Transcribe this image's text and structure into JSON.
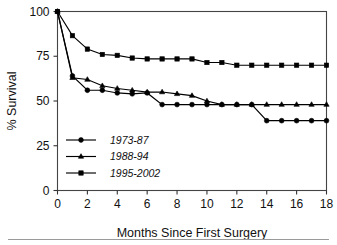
{
  "chart_data": {
    "type": "line",
    "title": "",
    "xlabel": "Months Since First Surgery",
    "ylabel": "% Survival",
    "x": [
      0,
      1,
      2,
      3,
      4,
      5,
      6,
      7,
      8,
      9,
      10,
      11,
      12,
      13,
      14,
      15,
      16,
      17,
      18
    ],
    "xlim": [
      0,
      18
    ],
    "ylim": [
      0,
      100
    ],
    "xticks": [
      0,
      2,
      4,
      6,
      8,
      10,
      12,
      14,
      16,
      18
    ],
    "yticks": [
      0,
      25,
      50,
      75,
      100
    ],
    "xtick_labels": [
      "0",
      "2",
      "4",
      "6",
      "8",
      "10",
      "12",
      "14",
      "16",
      "18"
    ],
    "ytick_labels": [
      "0",
      "25",
      "50",
      "75",
      "100"
    ],
    "grid": false,
    "legend_position": "lower left inside axes",
    "series": [
      {
        "name": "1973-87",
        "marker": "circle",
        "values": [
          100,
          64,
          56,
          56,
          54.5,
          54,
          54.5,
          48,
          48,
          48,
          48,
          48,
          48,
          48,
          39,
          39,
          39,
          39,
          39
        ]
      },
      {
        "name": "1988-94",
        "marker": "triangle",
        "values": [
          100,
          63,
          62,
          58.5,
          57,
          56,
          55,
          55,
          54,
          53,
          50,
          48,
          48,
          48,
          48,
          48,
          48,
          48,
          48
        ]
      },
      {
        "name": "1995-2002",
        "marker": "square",
        "values": [
          100,
          86.5,
          79,
          76,
          75.5,
          74,
          73.5,
          73.5,
          73.5,
          73.5,
          71.5,
          71.5,
          70,
          70,
          70,
          70,
          70,
          70,
          70
        ]
      }
    ]
  },
  "legend": {
    "entries": [
      {
        "label": "1973-87",
        "marker": "circle-marker"
      },
      {
        "label": "1988-94",
        "marker": "triangle-marker"
      },
      {
        "label": "1995-2002",
        "marker": "square-marker"
      }
    ]
  },
  "axes": {
    "x_title": "Months Since First Surgery",
    "y_title": "% Survival"
  },
  "colors": {
    "series": "#000000",
    "axis": "#444444",
    "background": "#ffffff",
    "text": "#111111"
  }
}
